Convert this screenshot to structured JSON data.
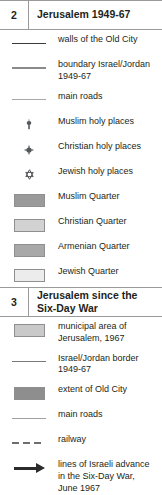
{
  "legend": {
    "sections": [
      {
        "number": "2",
        "title": "Jerusalem 1949-67",
        "entries": [
          {
            "symbol": "line-walls",
            "label": "walls of the Old City"
          },
          {
            "symbol": "line-boundary",
            "label": "boundary Israel/Jordan 1949-67"
          },
          {
            "symbol": "line-main-roads",
            "label": "main roads"
          },
          {
            "symbol": "muslim-holy-icon",
            "label": "Muslim holy places"
          },
          {
            "symbol": "christian-holy-icon",
            "label": "Christian holy places"
          },
          {
            "symbol": "jewish-holy-icon",
            "label": "Jewish holy places"
          },
          {
            "symbol": "swatch-muslim",
            "label": "Muslim Quarter",
            "color": "#9a9a9a"
          },
          {
            "symbol": "swatch-christian",
            "label": "Christian Quarter",
            "color": "#d2d2d2"
          },
          {
            "symbol": "swatch-armenian",
            "label": "Armenian Quarter",
            "color": "#a8a8a8"
          },
          {
            "symbol": "swatch-jewish",
            "label": "Jewish Quarter",
            "color": "#ececec"
          }
        ]
      },
      {
        "number": "3",
        "title": "Jerusalem since the Six-Day War",
        "entries": [
          {
            "symbol": "swatch-municipal",
            "label": "municipal area of Jerusalem, 1967",
            "color": "#c9c9c9"
          },
          {
            "symbol": "line-border-49-67",
            "label": "Israel/Jordan border 1949-67"
          },
          {
            "symbol": "swatch-old-city",
            "label": "extent of Old City",
            "color": "#8e8e8e"
          },
          {
            "symbol": "line-main-roads-2",
            "label": "main roads"
          },
          {
            "symbol": "line-railway",
            "label": "railway"
          },
          {
            "symbol": "arrow-advance",
            "label": "lines of Israeli advance in the Six-Day War, June 1967"
          }
        ]
      }
    ]
  },
  "colors": {
    "text": "#231f20",
    "rule": "#9a9a9a",
    "swatch_border": "#8f8f8f",
    "arrow": "#2b2b2b"
  }
}
